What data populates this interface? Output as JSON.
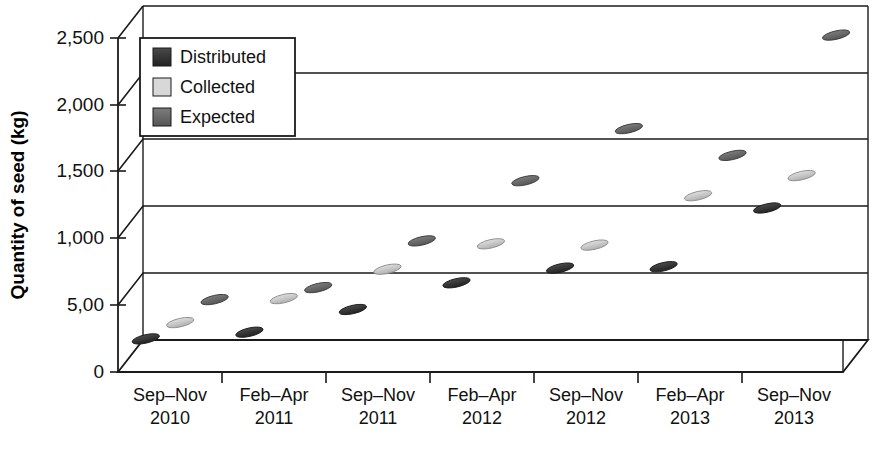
{
  "chart_data": {
    "type": "scatter",
    "title": "",
    "xlabel": "",
    "ylabel": "Quantity of seed (kg)",
    "ylim": [
      0,
      2500
    ],
    "ytick_labels": [
      "0",
      "5,00",
      "1,000",
      "1,500",
      "2,000",
      "2,500"
    ],
    "ytick_values": [
      0,
      500,
      1000,
      1500,
      2000,
      2500
    ],
    "grid": true,
    "legend_position": "top-left",
    "categories": [
      "Sep–Nov 2010",
      "Feb–Apr 2011",
      "Sep–Nov 2011",
      "Feb–Apr 2012",
      "Sep–Nov 2012",
      "Feb–Apr 2013",
      "Sep–Nov 2013"
    ],
    "category_lines": [
      {
        "top": "Sep–Nov",
        "bottom": "2010"
      },
      {
        "top": "Feb–Apr",
        "bottom": "2011"
      },
      {
        "top": "Sep–Nov",
        "bottom": "2011"
      },
      {
        "top": "Feb–Apr",
        "bottom": "2012"
      },
      {
        "top": "Sep–Nov",
        "bottom": "2012"
      },
      {
        "top": "Feb–Apr",
        "bottom": "2013"
      },
      {
        "top": "Sep–Nov",
        "bottom": "2013"
      }
    ],
    "series": [
      {
        "name": "Distributed",
        "color": "#3a3a3a",
        "values": [
          200,
          250,
          420,
          620,
          730,
          740,
          1180
        ]
      },
      {
        "name": "Collected",
        "color": "#c9c9c9",
        "values": [
          250,
          430,
          650,
          840,
          830,
          1200,
          1350
        ]
      },
      {
        "name": "Expected",
        "color": "#6e6e6e",
        "values": [
          350,
          440,
          790,
          1240,
          1630,
          1430,
          2330
        ]
      }
    ]
  },
  "legend": {
    "items": [
      {
        "label": "Distributed",
        "color": "#3a3a3a"
      },
      {
        "label": "Collected",
        "color": "#d2d2d2"
      },
      {
        "label": "Expected",
        "color": "#6e6e6e"
      }
    ]
  },
  "axis": {
    "y_title": "Quantity of seed (kg)",
    "y_ticks": [
      "2,500",
      "2,000",
      "1,500",
      "1,000",
      "5,00",
      "0"
    ]
  },
  "colors": {
    "line": "#1a1a1a",
    "background": "#ffffff",
    "distributed": "#3a3a3a",
    "collected": "#cccccc",
    "expected": "#6e6e6e"
  }
}
